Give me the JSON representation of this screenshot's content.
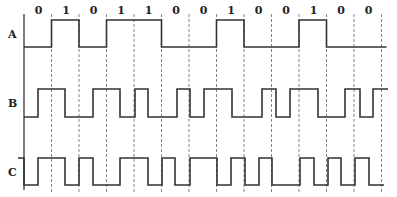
{
  "diagram": {
    "type": "digital-waveform-timing",
    "bits": [
      "0",
      "1",
      "0",
      "1",
      "1",
      "0",
      "0",
      "1",
      "0",
      "0",
      "1",
      "0",
      "0"
    ],
    "signals": [
      {
        "name": "A",
        "encoding": "NRZ"
      },
      {
        "name": "B",
        "encoding": "Manchester-like"
      },
      {
        "name": "C",
        "encoding": "Differential Manchester-like"
      }
    ],
    "colors": {
      "line": "#333333",
      "dashed": "#555555",
      "background": "#ffffff"
    }
  }
}
